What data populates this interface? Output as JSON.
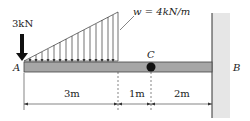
{
  "diagram": {
    "type": "beam-loading",
    "point_load": {
      "label": "3kN",
      "location": "A",
      "direction": "down"
    },
    "distributed_load": {
      "label": "w = 4kN/m",
      "shape": "triangular",
      "from": "A",
      "span_m": 3,
      "max_at_end": true
    },
    "points": {
      "A": "A",
      "B": "B",
      "C": "C"
    },
    "support_B": "fixed wall",
    "hinge_C": "internal hinge",
    "dimensions": [
      {
        "label": "3m",
        "value_m": 3
      },
      {
        "label": "1m",
        "value_m": 1
      },
      {
        "label": "2m",
        "value_m": 2
      }
    ],
    "colors": {
      "beam": "#a6a6a6",
      "wall": "#e6e6e6",
      "line": "#222222"
    }
  }
}
